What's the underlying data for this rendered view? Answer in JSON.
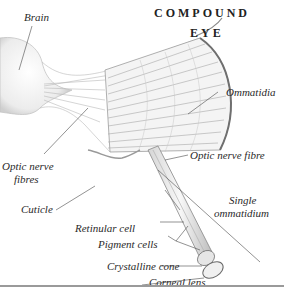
{
  "title": {
    "line1": "COMPOUND",
    "line2": "EYE"
  },
  "labels": {
    "brain": "Brain",
    "ommatidia": "Ommatidia",
    "optic_nerve_fibres_1": "Optic nerve",
    "optic_nerve_fibres_2": "fibres",
    "optic_nerve_fibre": "Optic nerve fibre",
    "cuticle": "Cuticle",
    "single_ommatidium_1": "Single",
    "single_ommatidium_2": "ommatidium",
    "retinular_cell": "Retinular cell",
    "pigment_cells": "Pigment cells",
    "crystalline_cone": "Crystalline cone",
    "corneal_lens": "Corneal lens"
  }
}
